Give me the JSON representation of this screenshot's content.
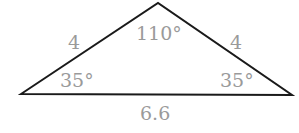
{
  "diagram": {
    "type": "triangle",
    "colors": {
      "stroke": "#1a1a1a",
      "label": "#9a9a9a",
      "background": "#ffffff"
    },
    "vertices": {
      "left": {
        "x": 21,
        "y": 94
      },
      "apex": {
        "x": 158,
        "y": 3
      },
      "right": {
        "x": 292,
        "y": 95
      }
    },
    "sides": {
      "left": "4",
      "right": "4",
      "base": "6.6"
    },
    "angles": {
      "apex": "110°",
      "left": "35°",
      "right": "35°"
    }
  }
}
